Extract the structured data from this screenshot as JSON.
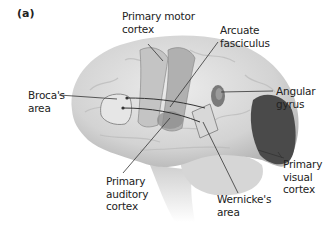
{
  "figure": {
    "panel_label": "(a)",
    "colors": {
      "brain_fill": "#d9d9d9",
      "brain_shadow": "#b8b8b8",
      "visual_cortex": "#4a4a4a",
      "angular_gyrus": "#7a7a7a",
      "motor_strip": "#a8a8a8",
      "leader_line": "#333333",
      "text": "#222222"
    }
  },
  "labels": {
    "primary_motor_cortex": "Primary motor\ncortex",
    "arcuate_fasciculus": "Arcuate\nfasciculus",
    "brocas_area": "Broca's\narea",
    "angular_gyrus": "Angular\ngyrus",
    "primary_auditory_cortex": "Primary\nauditory\ncortex",
    "primary_visual_cortex": "Primary\nvisual\ncortex",
    "wernickes_area": "Wernicke's\narea"
  }
}
